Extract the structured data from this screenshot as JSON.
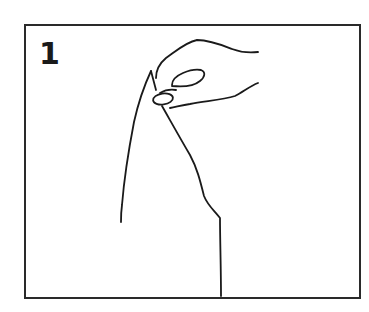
{
  "figure": {
    "step_number": "1",
    "frame_color": "#2a2a2a",
    "line_color": "#1a1a1a",
    "illustration": "hand-pinching-fabric-corner"
  }
}
